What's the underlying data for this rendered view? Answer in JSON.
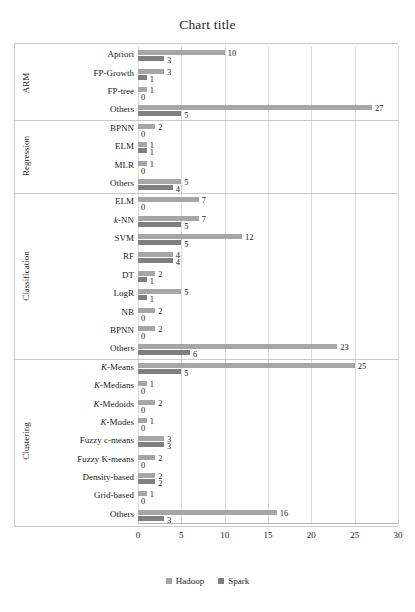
{
  "chart_data": {
    "type": "bar",
    "orientation": "horizontal",
    "title": "Chart title",
    "xlabel": "",
    "ylabel": "",
    "xlim": [
      0,
      30
    ],
    "xticks": [
      0,
      5,
      10,
      15,
      20,
      25,
      30
    ],
    "grid": true,
    "legend": [
      "Hadoop",
      "Spark"
    ],
    "legend_position": "bottom-center",
    "colors": {
      "Hadoop": "#a6a6a6",
      "Spark": "#7f7f7f"
    },
    "groups": [
      {
        "name": "ARM",
        "categories": [
          "Apriori",
          "FP-Growth",
          "FP-tree",
          "Others"
        ],
        "series": [
          {
            "name": "Hadoop",
            "values": [
              10,
              3,
              1,
              27
            ]
          },
          {
            "name": "Spark",
            "values": [
              3,
              1,
              0,
              5
            ]
          }
        ]
      },
      {
        "name": "Regression",
        "categories": [
          "BPNN",
          "ELM",
          "MLR",
          "Others"
        ],
        "series": [
          {
            "name": "Hadoop",
            "values": [
              2,
              1,
              1,
              5
            ]
          },
          {
            "name": "Spark",
            "values": [
              0,
              1,
              0,
              4
            ]
          }
        ]
      },
      {
        "name": "Classification",
        "categories": [
          "ELM",
          "k-NN",
          "SVM",
          "RF",
          "DT",
          "LogR",
          "NB",
          "BPNN",
          "Others"
        ],
        "series": [
          {
            "name": "Hadoop",
            "values": [
              7,
              7,
              12,
              4,
              2,
              5,
              2,
              2,
              23
            ]
          },
          {
            "name": "Spark",
            "values": [
              0,
              5,
              5,
              4,
              1,
              1,
              0,
              0,
              6
            ]
          }
        ]
      },
      {
        "name": "Clustering",
        "categories": [
          "K-Means",
          "K-Medians",
          "K-Medoids",
          "K-Modes",
          "Fuzzy c-means",
          "Fuzzy K-means",
          "Density-based",
          "Grid-based",
          "Others"
        ],
        "series": [
          {
            "name": "Hadoop",
            "values": [
              25,
              1,
              2,
              1,
              3,
              2,
              2,
              1,
              16
            ]
          },
          {
            "name": "Spark",
            "values": [
              5,
              0,
              0,
              0,
              3,
              0,
              2,
              0,
              3
            ]
          }
        ]
      }
    ]
  },
  "labels": {
    "rows": [
      {
        "text": "Apriori",
        "italic_prefix": ""
      },
      {
        "text": "FP-Growth",
        "italic_prefix": ""
      },
      {
        "text": "FP-tree",
        "italic_prefix": ""
      },
      {
        "text": "Others",
        "italic_prefix": ""
      },
      {
        "text": "BPNN",
        "italic_prefix": ""
      },
      {
        "text": "ELM",
        "italic_prefix": ""
      },
      {
        "text": "MLR",
        "italic_prefix": ""
      },
      {
        "text": "Others",
        "italic_prefix": ""
      },
      {
        "text": "ELM",
        "italic_prefix": ""
      },
      {
        "text": "-NN",
        "italic_prefix": "k"
      },
      {
        "text": "SVM",
        "italic_prefix": ""
      },
      {
        "text": "RF",
        "italic_prefix": ""
      },
      {
        "text": "DT",
        "italic_prefix": ""
      },
      {
        "text": "LogR",
        "italic_prefix": ""
      },
      {
        "text": "NB",
        "italic_prefix": ""
      },
      {
        "text": "BPNN",
        "italic_prefix": ""
      },
      {
        "text": "Others",
        "italic_prefix": ""
      },
      {
        "text": "-Means",
        "italic_prefix": "K"
      },
      {
        "text": "-Medians",
        "italic_prefix": "K"
      },
      {
        "text": "-Medoids",
        "italic_prefix": "K"
      },
      {
        "text": "-Modes",
        "italic_prefix": "K"
      },
      {
        "text": "Fuzzy c-means",
        "italic_prefix": ""
      },
      {
        "text": "Fuzzy K-means",
        "italic_prefix": ""
      },
      {
        "text": "Density-based",
        "italic_prefix": ""
      },
      {
        "text": "Grid-based",
        "italic_prefix": ""
      },
      {
        "text": "Others",
        "italic_prefix": ""
      }
    ]
  }
}
